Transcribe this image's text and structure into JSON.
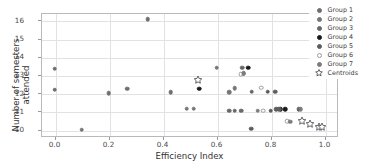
{
  "chart_data": {
    "type": "scatter",
    "title": "",
    "xlabel": "Efficiency Index",
    "ylabel": "Number of semesters attended",
    "xlim": [
      -0.05,
      1.05
    ],
    "ylim": [
      9.6,
      16.4
    ],
    "xticks": [
      "0.0",
      "0.2",
      "0.4",
      "0.6",
      "0.8",
      "1.0"
    ],
    "xtick_values": [
      0.0,
      0.2,
      0.4,
      0.6,
      0.8,
      1.0
    ],
    "yticks": [
      "10",
      "11",
      "12",
      "13",
      "14",
      "15",
      "16"
    ],
    "ytick_values": [
      10,
      11,
      12,
      13,
      14,
      15,
      16
    ],
    "grid": true,
    "legend_position": "upper right",
    "series": [
      {
        "name": "Group 1",
        "color": "#6f6f6f",
        "marker": "circle",
        "filled": true,
        "points": [
          {
            "x": 0.0,
            "y": 13.35
          },
          {
            "x": 0.0,
            "y": 12.2
          },
          {
            "x": 0.2,
            "y": 12.0
          },
          {
            "x": 0.27,
            "y": 12.25
          },
          {
            "x": 0.345,
            "y": 16.05
          },
          {
            "x": 0.43,
            "y": 12.05
          }
        ]
      },
      {
        "name": "Group 2",
        "color": "#777777",
        "marker": "circle",
        "filled": true,
        "points": [
          {
            "x": 0.1,
            "y": 10.0
          },
          {
            "x": 0.49,
            "y": 11.15
          },
          {
            "x": 0.515,
            "y": 11.15
          },
          {
            "x": 0.6,
            "y": 13.4
          },
          {
            "x": 0.648,
            "y": 12.05
          },
          {
            "x": 0.668,
            "y": 12.28
          }
        ]
      },
      {
        "name": "Group 3",
        "color": "#686868",
        "marker": "circle",
        "filled": true,
        "points": [
          {
            "x": 0.648,
            "y": 11.05
          },
          {
            "x": 0.668,
            "y": 11.05
          },
          {
            "x": 0.692,
            "y": 11.05
          },
          {
            "x": 0.695,
            "y": 13.4
          },
          {
            "x": 0.698,
            "y": 13.08
          },
          {
            "x": 0.73,
            "y": 12.08
          }
        ]
      },
      {
        "name": "Group 4",
        "color": "#1a1a1a",
        "marker": "circle",
        "filled": true,
        "points": [
          {
            "x": 0.535,
            "y": 12.25
          },
          {
            "x": 0.718,
            "y": 13.4
          },
          {
            "x": 0.838,
            "y": 11.12
          },
          {
            "x": 0.855,
            "y": 11.12
          }
        ]
      },
      {
        "name": "Group 5",
        "color": "#5d5d5d",
        "marker": "circle",
        "filled": true,
        "points": [
          {
            "x": 0.728,
            "y": 10.05
          },
          {
            "x": 0.79,
            "y": 12.08
          },
          {
            "x": 0.818,
            "y": 12.08
          },
          {
            "x": 0.8,
            "y": 11.05
          },
          {
            "x": 0.822,
            "y": 11.12
          },
          {
            "x": 0.832,
            "y": 11.12
          },
          {
            "x": 0.905,
            "y": 11.12
          }
        ]
      },
      {
        "name": "Group 6",
        "color": "#9a9a9a",
        "marker": "circle",
        "filled": false,
        "points": [
          {
            "x": 0.765,
            "y": 12.3
          },
          {
            "x": 0.772,
            "y": 11.05
          },
          {
            "x": 0.69,
            "y": 13.05
          },
          {
            "x": 0.862,
            "y": 10.48
          }
        ]
      },
      {
        "name": "Group 7",
        "color": "#7c7c7c",
        "marker": "circle",
        "filled": true,
        "points": [
          {
            "x": 0.7,
            "y": 13.1
          },
          {
            "x": 0.873,
            "y": 10.45
          },
          {
            "x": 0.752,
            "y": 11.05
          },
          {
            "x": 0.912,
            "y": 11.12
          }
        ]
      },
      {
        "name": "Centroids",
        "color": "#ffffff",
        "edge": "#4a4a4a",
        "marker": "star",
        "filled": false,
        "points": [
          {
            "x": 0.532,
            "y": 12.75
          },
          {
            "x": 0.918,
            "y": 10.48
          },
          {
            "x": 0.945,
            "y": 10.33
          },
          {
            "x": 0.978,
            "y": 10.17
          },
          {
            "x": 0.992,
            "y": 10.13
          }
        ]
      }
    ]
  },
  "legend": {
    "items": [
      {
        "label": "Group 1"
      },
      {
        "label": "Group 2"
      },
      {
        "label": "Group 3"
      },
      {
        "label": "Group 4"
      },
      {
        "label": "Group 5"
      },
      {
        "label": "Group 6"
      },
      {
        "label": "Group 7"
      },
      {
        "label": "Centroids"
      }
    ]
  }
}
